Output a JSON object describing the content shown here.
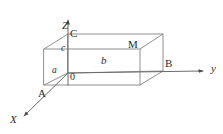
{
  "figure": {
    "background_color": "#ffffff",
    "stroke_color": "#8a8a8a",
    "axis_color": "#6b6b6b",
    "text_color": "#2b2b2b"
  },
  "axes": [
    {
      "name": "z-axis",
      "label": "Z",
      "style": "italic"
    },
    {
      "name": "y-axis",
      "label": "y",
      "style": "italic"
    },
    {
      "name": "x-axis",
      "label": "X",
      "style": "italic"
    }
  ],
  "labels": {
    "z_axis": "Z",
    "y_axis": "y",
    "x_axis": "X",
    "vertex_c": "C",
    "vertex_m": "M",
    "vertex_b": "B",
    "vertex_a": "A",
    "origin": "0",
    "edge_a": "a",
    "edge_b": "b",
    "edge_c": "c"
  },
  "geometry": {
    "origin": {
      "x": 68,
      "y": 73
    },
    "vertices": {
      "O": {
        "x": 68,
        "y": 73,
        "label": "0"
      },
      "A": {
        "x": 44,
        "y": 85,
        "label": "A"
      },
      "B": {
        "x": 163,
        "y": 71,
        "label": "B"
      },
      "C": {
        "x": 68,
        "y": 34,
        "label": "C"
      },
      "M": {
        "x": 140,
        "y": 49,
        "label": "M"
      },
      "front_top_left": {
        "x": 44,
        "y": 49
      },
      "front_bottom_right": {
        "x": 140,
        "y": 85
      },
      "back_top_right": {
        "x": 163,
        "y": 34
      }
    },
    "axis_ends": {
      "z": {
        "x": 68,
        "y": 18
      },
      "y": {
        "x": 205,
        "y": 71
      },
      "x": {
        "x": 22,
        "y": 117
      }
    }
  }
}
